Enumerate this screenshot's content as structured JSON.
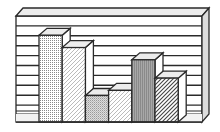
{
  "chart_data": {
    "type": "bar",
    "style": "3d-monochrome-illustration",
    "title": "",
    "xlabel": "",
    "ylabel": "",
    "categories": [
      "1",
      "2",
      "3",
      "4",
      "5",
      "6"
    ],
    "values": [
      8.5,
      7.3,
      2.6,
      3.1,
      6.1,
      4.3
    ],
    "ylim": [
      0,
      10
    ],
    "grid": true,
    "legend": null,
    "bar_patterns": [
      "dots",
      "light-diagonal",
      "fine-crosshatch",
      "light-diagonal",
      "vertical-dense",
      "bold-diagonal"
    ]
  },
  "colors": {
    "outline": "#2a2a2a",
    "face": "#ffffff",
    "top": "#ececec",
    "side": "#dcdcdc",
    "pattern": "#555555"
  }
}
